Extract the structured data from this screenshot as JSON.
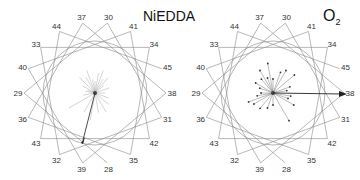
{
  "panels": [
    {
      "id": "niedda",
      "title": "NiEDDA",
      "center": [
        95,
        93
      ],
      "label_radius": 75,
      "circle_radius": 52
    },
    {
      "id": "o2",
      "title": "O",
      "title_sub": "2",
      "center": [
        273,
        93
      ],
      "label_radius": 75,
      "circle_radius": 52
    }
  ],
  "wheel_order": [
    "37",
    "30",
    "41",
    "34",
    "45",
    "38",
    "31",
    "42",
    "35",
    "28",
    "39",
    "32",
    "43",
    "36",
    "29",
    "40",
    "33",
    "44"
  ],
  "residue_sequence": [
    "28",
    "29",
    "30",
    "31",
    "32",
    "33",
    "34",
    "35",
    "36",
    "37",
    "38",
    "39",
    "40",
    "41",
    "42",
    "43",
    "44",
    "45"
  ],
  "colors": {
    "line": "#888888",
    "text": "#333333",
    "vector": "#222222"
  }
}
